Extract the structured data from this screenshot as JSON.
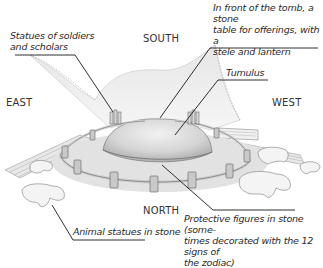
{
  "diagram": {
    "directions": {
      "south": "SOUTH",
      "east": "EAST",
      "west": "WEST",
      "north": "NORTH"
    },
    "labels": {
      "soldiers_line1": "Statues of soldiers",
      "soldiers_line2": "and scholars",
      "offering_line1": "In front of the tomb, a stone",
      "offering_line2": "table for offerings, with a",
      "offering_line3": "stele and lantern",
      "tumulus": "Tumulus",
      "animals": "Animal statues in stone",
      "protective_line1": "Protective figures in stone (some-",
      "protective_line2": "times decorated with the 12 signs of",
      "protective_line3": "the zodiac)"
    },
    "colors": {
      "ink": "#2a2a2a",
      "stone": "#d8d8d8",
      "shadow": "#8a8a8a",
      "background": "#ffffff"
    }
  }
}
